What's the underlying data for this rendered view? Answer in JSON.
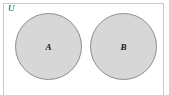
{
  "diagram": {
    "type": "venn-diagram",
    "universe": {
      "label": "U",
      "border_color": "#c9c9c9",
      "background_color": "#ffffff"
    },
    "sets": [
      {
        "label": "A",
        "fill_color": "#d7d7d7",
        "stroke_color": "#8e8e8e"
      },
      {
        "label": "B",
        "fill_color": "#d7d7d7",
        "stroke_color": "#8e8e8e"
      }
    ]
  }
}
